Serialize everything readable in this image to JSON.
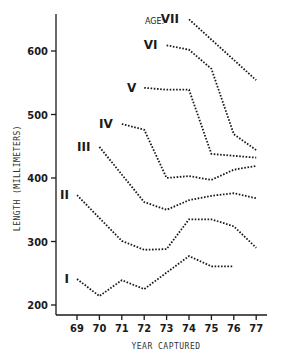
{
  "chart_data": {
    "type": "line",
    "title": "",
    "xlabel": "YEAR CAPTURED",
    "ylabel": "LENGTH (MILLIMETERS)",
    "legend_prefix": "AGE:",
    "x": [
      69,
      70,
      71,
      72,
      73,
      74,
      75,
      76,
      77
    ],
    "x_tick_labels": [
      "69",
      "70",
      "71",
      "72",
      "73",
      "74",
      "75",
      "76",
      "77"
    ],
    "y_tick_labels": [
      "200",
      "300",
      "400",
      "500",
      "600"
    ],
    "y_ticks": [
      200,
      300,
      400,
      500,
      600
    ],
    "ylim": [
      185,
      660
    ],
    "xlim": [
      68,
      77.5
    ],
    "grid": false,
    "series": [
      {
        "name": "I",
        "x": [
          69,
          70,
          71,
          72,
          74,
          75,
          76
        ],
        "values": [
          241,
          214,
          239,
          225,
          277,
          261,
          261
        ]
      },
      {
        "name": "II",
        "x": [
          69,
          71,
          72,
          73,
          74,
          75,
          76,
          77
        ],
        "values": [
          373,
          301,
          287,
          288,
          335,
          335,
          324,
          290
        ]
      },
      {
        "name": "III",
        "x": [
          70,
          72,
          73,
          74,
          75,
          76,
          77
        ],
        "values": [
          449,
          362,
          350,
          365,
          372,
          376,
          368
        ]
      },
      {
        "name": "IV",
        "x": [
          71,
          72,
          73,
          74,
          75,
          76,
          77
        ],
        "values": [
          485,
          476,
          400,
          403,
          397,
          413,
          419
        ]
      },
      {
        "name": "V",
        "x": [
          72,
          73,
          74,
          75,
          76,
          77
        ],
        "values": [
          542,
          539,
          539,
          438,
          435,
          432
        ]
      },
      {
        "name": "VI",
        "x": [
          73,
          74,
          75,
          76,
          77
        ],
        "values": [
          609,
          602,
          572,
          469,
          444
        ]
      },
      {
        "name": "VII",
        "x": [
          74,
          77
        ],
        "values": [
          650,
          554
        ]
      }
    ]
  },
  "labels": {
    "age_prefix": "AGE:",
    "series": [
      "I",
      "II",
      "III",
      "IV",
      "V",
      "VI",
      "VII"
    ]
  }
}
